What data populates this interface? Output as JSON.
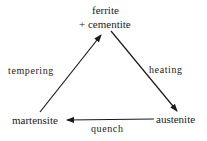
{
  "diagram": {
    "nodes": [
      {
        "id": "ferrite_cementite",
        "line1": "ferrite",
        "line2": "+ cementite"
      },
      {
        "id": "austenite",
        "label": "austenite"
      },
      {
        "id": "martensite",
        "label": "martensite"
      }
    ],
    "edges": [
      {
        "from": "ferrite_cementite",
        "to": "austenite",
        "label": "heating"
      },
      {
        "from": "austenite",
        "to": "martensite",
        "label": "quench"
      },
      {
        "from": "martensite",
        "to": "ferrite_cementite",
        "label": "tempering"
      }
    ],
    "colors": {
      "ink": "#1a1a1a",
      "background": "#ffffff"
    }
  }
}
